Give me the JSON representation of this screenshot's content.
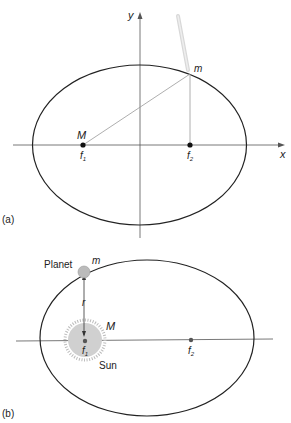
{
  "figure_a": {
    "panel_label": "(a)",
    "axis_x_label": "x",
    "axis_y_label": "y",
    "mass_M_label": "M",
    "mass_m_label": "m",
    "focus1_label": "f",
    "focus1_sub": "1",
    "focus2_label": "f",
    "focus2_sub": "2"
  },
  "figure_b": {
    "panel_label": "(b)",
    "planet_label": "Planet",
    "mass_m_label": "m",
    "radius_label": "r",
    "mass_M_label": "M",
    "sun_label": "Sun",
    "focus1_label": "f",
    "focus1_sub": "1",
    "focus2_label": "f",
    "focus2_sub": "2"
  },
  "colors": {
    "ellipse": "#222222",
    "axis": "#555555",
    "string": "#999999",
    "sun_fill": "#d0d0d0",
    "planet_fill": "#bbbbbb"
  }
}
